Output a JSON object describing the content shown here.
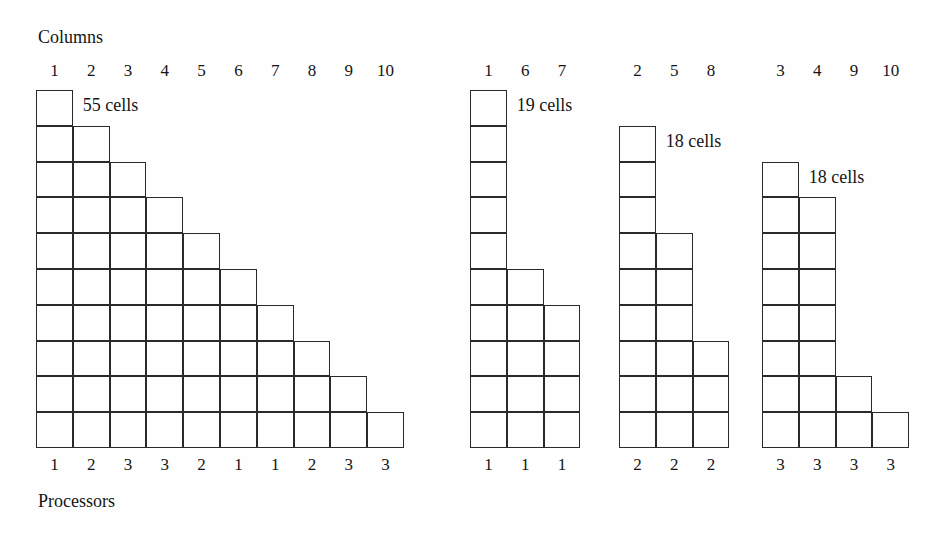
{
  "figure": {
    "top_axis_label": "Columns",
    "bottom_axis_label": "Processors",
    "background_color": "#fefefe",
    "line_color": "#2a2a2a",
    "total_rows": 10
  },
  "chart_data": {
    "type": "diagram",
    "title": "Columns",
    "xlabel": "Processors",
    "ylabel": "",
    "groups": [
      {
        "name": "full-triangle",
        "count_label": "55 cells",
        "cells_total": 55,
        "column_headers": [
          "1",
          "2",
          "3",
          "4",
          "5",
          "6",
          "7",
          "8",
          "9",
          "10"
        ],
        "processor_labels": [
          "1",
          "2",
          "3",
          "3",
          "2",
          "1",
          "1",
          "2",
          "3",
          "3"
        ],
        "columns": [
          {
            "header": "1",
            "processor": "1",
            "start_row": 1,
            "height": 10
          },
          {
            "header": "2",
            "processor": "2",
            "start_row": 2,
            "height": 9
          },
          {
            "header": "3",
            "processor": "3",
            "start_row": 3,
            "height": 8
          },
          {
            "header": "4",
            "processor": "3",
            "start_row": 4,
            "height": 7
          },
          {
            "header": "5",
            "processor": "2",
            "start_row": 5,
            "height": 6
          },
          {
            "header": "6",
            "processor": "1",
            "start_row": 6,
            "height": 5
          },
          {
            "header": "7",
            "processor": "1",
            "start_row": 7,
            "height": 4
          },
          {
            "header": "8",
            "processor": "2",
            "start_row": 8,
            "height": 3
          },
          {
            "header": "9",
            "processor": "3",
            "start_row": 9,
            "height": 2
          },
          {
            "header": "10",
            "processor": "3",
            "start_row": 10,
            "height": 1
          }
        ]
      },
      {
        "name": "processor-1",
        "count_label": "19 cells",
        "cells_total": 19,
        "column_headers": [
          "1",
          "6",
          "7"
        ],
        "processor_labels": [
          "1",
          "1",
          "1"
        ],
        "columns": [
          {
            "header": "1",
            "processor": "1",
            "start_row": 1,
            "height": 10
          },
          {
            "header": "6",
            "processor": "1",
            "start_row": 6,
            "height": 5
          },
          {
            "header": "7",
            "processor": "1",
            "start_row": 7,
            "height": 4
          }
        ]
      },
      {
        "name": "processor-2",
        "count_label": "18 cells",
        "cells_total": 18,
        "column_headers": [
          "2",
          "5",
          "8"
        ],
        "processor_labels": [
          "2",
          "2",
          "2"
        ],
        "columns": [
          {
            "header": "2",
            "processor": "2",
            "start_row": 2,
            "height": 9
          },
          {
            "header": "5",
            "processor": "2",
            "start_row": 5,
            "height": 6
          },
          {
            "header": "8",
            "processor": "2",
            "start_row": 8,
            "height": 3
          }
        ]
      },
      {
        "name": "processor-3",
        "count_label": "18 cells",
        "cells_total": 18,
        "column_headers": [
          "3",
          "4",
          "9",
          "10"
        ],
        "processor_labels": [
          "3",
          "3",
          "3",
          "3"
        ],
        "columns": [
          {
            "header": "3",
            "processor": "3",
            "start_row": 3,
            "height": 8
          },
          {
            "header": "4",
            "processor": "3",
            "start_row": 4,
            "height": 7
          },
          {
            "header": "9",
            "processor": "3",
            "start_row": 9,
            "height": 2
          },
          {
            "header": "10",
            "processor": "3",
            "start_row": 10,
            "height": 1
          }
        ]
      }
    ]
  },
  "layout": {
    "cell_w": 36.8,
    "cell_h": 35.8,
    "baseline_y": 448,
    "group_origins_x": [
      36,
      470,
      619,
      762
    ],
    "header_y": 62,
    "processor_y": 456,
    "top_label": {
      "x": 38,
      "y": 28
    },
    "bottom_label": {
      "x": 38,
      "y": 492
    },
    "count_label_dx": 10,
    "count_label_dy": 6
  }
}
